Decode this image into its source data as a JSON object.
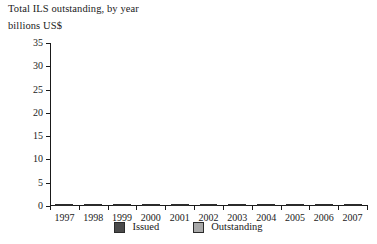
{
  "chart_data": {
    "type": "bar",
    "title": "Total ILS outstanding, by year",
    "subtitle": "billions US$",
    "xlabel": "",
    "ylabel": "billions US$",
    "stacked": true,
    "grid": false,
    "legend_position": "bottom",
    "ylim": [
      0,
      35
    ],
    "yticks": [
      0,
      5,
      10,
      15,
      20,
      25,
      30,
      35
    ],
    "ytick_labels": [
      "0",
      "5",
      "10",
      "15",
      "20",
      "25",
      "30",
      "35"
    ],
    "categories": [
      "1997",
      "1998",
      "1999",
      "2000",
      "2001",
      "2002",
      "2003",
      "2004",
      "2005",
      "2006",
      "2007"
    ],
    "series": [
      {
        "name": "Issued",
        "color": "#4a4a4a",
        "values": [
          0.8,
          1.5,
          1.1,
          1.8,
          1.0,
          2.0,
          4.9,
          3.6,
          6.0,
          10.4,
          10.0
        ]
      },
      {
        "name": "Outstanding",
        "color": "#a8a8a8",
        "values": [
          0.2,
          0.2,
          1.3,
          2.0,
          4.9,
          5.1,
          6.2,
          9.2,
          12.0,
          15.2,
          24.5
        ]
      }
    ],
    "totals": [
      1.0,
      1.7,
      2.4,
      3.8,
      5.9,
      7.1,
      11.1,
      12.8,
      18.0,
      25.6,
      34.5
    ]
  },
  "colors": {
    "issued": "#4a4a4a",
    "outstanding": "#a8a8a8",
    "outline": "#2b2b2b",
    "axis": "#1a1a1a",
    "background": "#ffffff"
  }
}
